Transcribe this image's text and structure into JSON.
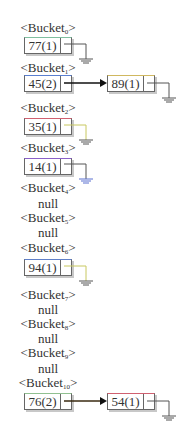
{
  "diagram": {
    "title": "",
    "buckets": [
      {
        "name": "Bucket",
        "index": "0",
        "nodes": [
          {
            "value": "77(1)",
            "top_color": "#7fbf9f"
          }
        ]
      },
      {
        "name": "Bucket",
        "index": "1",
        "nodes": [
          {
            "value": "45(2)",
            "top_color": "#5a7fd0"
          },
          {
            "value": "89(1)",
            "top_color": "#d0b860"
          }
        ]
      },
      {
        "name": "Bucket",
        "index": "2",
        "nodes": [
          {
            "value": "35(1)",
            "top_color": "#d06070"
          }
        ]
      },
      {
        "name": "Bucket",
        "index": "3",
        "nodes": [
          {
            "value": "14(1)",
            "top_color": "#8a60c8"
          }
        ]
      },
      {
        "name": "Bucket",
        "index": "4",
        "null_label": "null"
      },
      {
        "name": "Bucket",
        "index": "5",
        "null_label": "null"
      },
      {
        "name": "Bucket",
        "index": "6",
        "nodes": [
          {
            "value": "94(1)",
            "top_color": "#6080c8"
          }
        ]
      },
      {
        "name": "Bucket",
        "index": "7",
        "null_label": "null"
      },
      {
        "name": "Bucket",
        "index": "8",
        "null_label": "null"
      },
      {
        "name": "Bucket",
        "index": "9",
        "null_label": "null"
      },
      {
        "name": "Bucket",
        "index": "10",
        "nodes": [
          {
            "value": "76(2)",
            "top_color": "#90c090"
          },
          {
            "value": "54(1)",
            "top_color": "#d06070"
          }
        ]
      }
    ],
    "colors": {
      "arrow": "#111111",
      "border": "#666666",
      "ground_default": "#666666",
      "ground_bucket2": "#c8c860",
      "ground_bucket3": "#5a70d0",
      "ground_bucket6": "#c8c860"
    }
  }
}
